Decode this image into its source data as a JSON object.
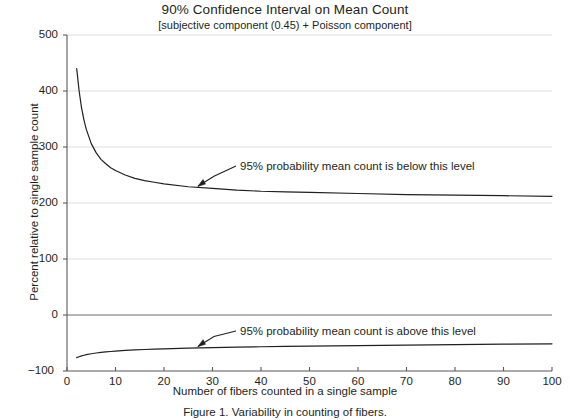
{
  "chart_data": {
    "type": "line",
    "title": "90% Confidence Interval on Mean Count",
    "subtitle": "[subjective component (0.45) + Poisson component]",
    "xlabel": "Number of fibers counted in a single sample",
    "ylabel": "Percent relative to single sample count",
    "xlim": [
      0,
      100
    ],
    "ylim": [
      -100,
      500
    ],
    "xticks": [
      0,
      10,
      20,
      30,
      40,
      50,
      60,
      70,
      80,
      90,
      100
    ],
    "yticks": [
      -100,
      0,
      100,
      200,
      300,
      400,
      500
    ],
    "grid": "horizontal",
    "legend": "none",
    "zero_line": true,
    "line_color": "#231f20",
    "grid_color": "#d9d9d9",
    "axis_color": "#58595b",
    "series": [
      {
        "name": "upper-confidence-bound",
        "label": "95% probability mean count is below this level",
        "x": [
          2,
          2.5,
          3,
          3.5,
          4,
          5,
          6,
          7,
          8,
          9,
          10,
          12,
          14,
          16,
          18,
          20,
          25,
          30,
          35,
          40,
          45,
          50,
          60,
          70,
          80,
          90,
          100
        ],
        "values": [
          440,
          400,
          370,
          348,
          331,
          306,
          290,
          278,
          270,
          263,
          258,
          250,
          244,
          240,
          237,
          234,
          229,
          226,
          223,
          221,
          220,
          219,
          217,
          215,
          214,
          213,
          212
        ]
      },
      {
        "name": "lower-confidence-bound",
        "label": "95% probability mean count is above this level",
        "x": [
          2,
          2.5,
          3,
          3.5,
          4,
          5,
          6,
          7,
          8,
          9,
          10,
          12,
          14,
          16,
          18,
          20,
          25,
          30,
          35,
          40,
          45,
          50,
          60,
          70,
          80,
          90,
          100
        ],
        "values": [
          -76,
          -74.5,
          -73,
          -71.8,
          -70.8,
          -69.2,
          -67.9,
          -66.8,
          -65.9,
          -65.2,
          -64.5,
          -63.3,
          -62.4,
          -61.6,
          -61,
          -60.4,
          -59.2,
          -58.2,
          -57.4,
          -56.7,
          -56.1,
          -55.6,
          -54.6,
          -53.7,
          -52.9,
          -52.1,
          -51.4
        ]
      }
    ],
    "annotations": [
      {
        "name": "upper-annotation",
        "text": "95% probability mean count is below this level",
        "target_x": 27,
        "target_y": 228
      },
      {
        "name": "lower-annotation",
        "text": "95% probability mean count is above this level",
        "target_x": 27,
        "target_y": -58
      }
    ]
  },
  "caption": "Figure 1. Variability in counting of fibers.",
  "axis": {
    "ytick_labels": [
      "500",
      "400",
      "300",
      "200",
      "100",
      "0",
      "−100"
    ],
    "xtick_labels": [
      "0",
      "10",
      "20",
      "30",
      "40",
      "50",
      "60",
      "70",
      "80",
      "90",
      "100"
    ]
  }
}
